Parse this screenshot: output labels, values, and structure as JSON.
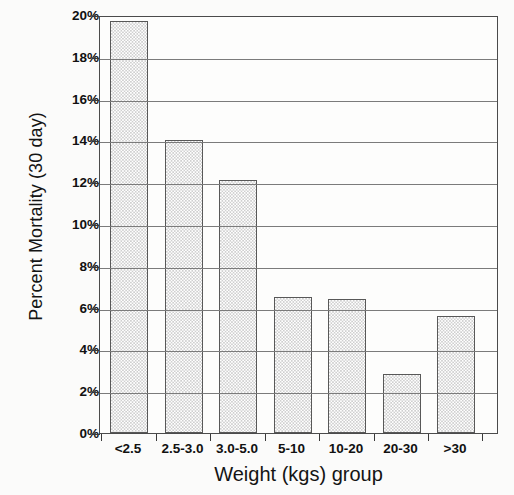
{
  "chart_data": {
    "type": "bar",
    "title": "",
    "xlabel": "Weight (kgs) group",
    "ylabel": "Percent Mortality (30 day)",
    "categories": [
      "<2.5",
      "2.5-3.0",
      "3.0-5.0",
      "5-10",
      "10-20",
      "20-30",
      ">30"
    ],
    "values": [
      19.7,
      14.0,
      12.1,
      6.5,
      6.4,
      2.8,
      5.6
    ],
    "ylim": [
      0,
      20
    ],
    "ytick_values": [
      0,
      2,
      4,
      6,
      8,
      10,
      12,
      14,
      16,
      18,
      20
    ],
    "ytick_labels": [
      "0%",
      "2%",
      "4%",
      "6%",
      "8%",
      "10%",
      "12%",
      "14%",
      "16%",
      "18%",
      "20%"
    ],
    "grid": true,
    "legend": "none",
    "bar_fill": "#e8e8e8",
    "bar_pattern": "fine-checker-stipple",
    "bar_edge_color": "#585858",
    "axis_color": "#4b4b4b",
    "background": "#fbfbfa"
  }
}
